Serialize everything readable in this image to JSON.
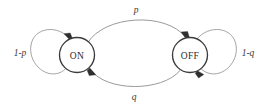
{
  "diagram": {
    "type": "state-transition-diagram",
    "canvas": {
      "width": 269,
      "height": 107,
      "background": "#ffffff"
    },
    "style": {
      "node_stroke": "#3b3b3b",
      "node_fill": "#ffffff",
      "edge_stroke": "#8e8e8e",
      "loop_stroke": "#9a9a9a",
      "arrow_fill": "#2f2f2f",
      "label_color": "#2b2b2b"
    },
    "nodes": [
      {
        "id": "on",
        "label": "ON",
        "cx": 77,
        "cy": 55,
        "r": 17.5
      },
      {
        "id": "off",
        "label": "OFF",
        "cx": 190,
        "cy": 55,
        "r": 17.5
      }
    ],
    "edges": [
      {
        "id": "on-to-off",
        "label": "p",
        "from": "on",
        "to": "off",
        "kind": "arc",
        "position": "top",
        "label_x": 136,
        "label_y": 10
      },
      {
        "id": "off-to-on",
        "label": "q",
        "from": "off",
        "to": "on",
        "kind": "arc",
        "position": "bottom",
        "label_x": 134,
        "label_y": 97
      },
      {
        "id": "on-self-loop",
        "label": "1-p",
        "from": "on",
        "to": "on",
        "kind": "self-loop",
        "position": "left",
        "label_x": 20,
        "label_y": 53
      },
      {
        "id": "off-self-loop",
        "label": "1-q",
        "from": "off",
        "to": "off",
        "kind": "self-loop",
        "position": "right",
        "label_x": 248,
        "label_y": 53
      }
    ]
  }
}
